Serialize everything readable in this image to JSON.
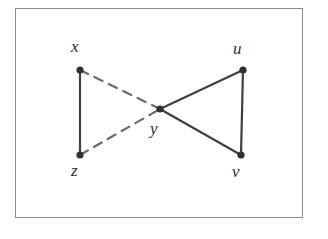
{
  "figure": {
    "kind": "graph-diagram",
    "background_color": "#ffffff",
    "frame": {
      "border_color": "#8d8d8d",
      "fill_color": "#ffffff",
      "x": 15,
      "y": 8,
      "width": 288,
      "height": 210
    },
    "style": {
      "edge_color": "#404040",
      "dashed_edge_color": "#6b6b6b",
      "node_color": "#303030",
      "label_color": "#2e2e2e",
      "edge_width": 2.2,
      "dashed_edge_width": 2.2,
      "dash_pattern": "9 7",
      "node_radius": 3.6
    },
    "nodes": [
      {
        "id": "x",
        "label": "x",
        "x": 80,
        "y": 70,
        "label_x": 71,
        "label_y": 38
      },
      {
        "id": "u",
        "label": "u",
        "x": 243,
        "y": 70,
        "label_x": 233,
        "label_y": 40
      },
      {
        "id": "y",
        "label": "y",
        "x": 160,
        "y": 109,
        "label_x": 150,
        "label_y": 120
      },
      {
        "id": "z",
        "label": "z",
        "x": 80,
        "y": 155,
        "label_x": 71,
        "label_y": 162
      },
      {
        "id": "v",
        "label": "v",
        "x": 241,
        "y": 155,
        "label_x": 232,
        "label_y": 163
      }
    ],
    "edges": [
      {
        "from": "x",
        "to": "z",
        "style": "solid"
      },
      {
        "from": "u",
        "to": "v",
        "style": "solid"
      },
      {
        "from": "y",
        "to": "u",
        "style": "solid"
      },
      {
        "from": "y",
        "to": "v",
        "style": "solid"
      },
      {
        "from": "x",
        "to": "y",
        "style": "dashed"
      },
      {
        "from": "z",
        "to": "y",
        "style": "dashed"
      }
    ]
  }
}
